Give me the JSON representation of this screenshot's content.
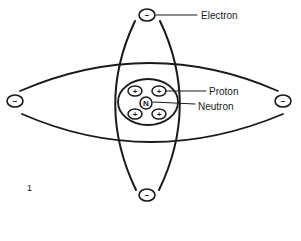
{
  "diagram": {
    "type": "atom-model",
    "labels": {
      "electron": "Electron",
      "proton": "Proton",
      "neutron": "Neutron"
    },
    "symbols": {
      "electron": "−",
      "proton": "+",
      "neutron": "N"
    },
    "figure_number": "1",
    "counts": {
      "electrons": 4,
      "protons": 4,
      "neutrons": 1
    },
    "colors": {
      "line": "#1a1a1a",
      "background": "#ffffff"
    }
  }
}
